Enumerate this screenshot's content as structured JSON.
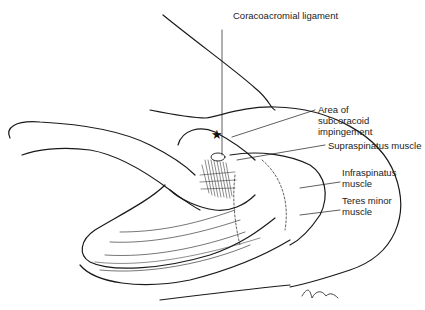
{
  "figure": {
    "type": "anatomical line illustration",
    "line_color": "#1a1a1a",
    "background": "#ffffff"
  },
  "labels": {
    "coracoacromial": "Coracoacromial ligament",
    "impingement": [
      "Area of",
      "subcoracoid",
      "impingement"
    ],
    "supraspinatus": "Supraspinatus muscle",
    "infraspinatus": [
      "Infraspinatus",
      "muscle"
    ],
    "teres_minor": [
      "Teres minor",
      "muscle"
    ]
  },
  "markers": {
    "star": "★"
  },
  "signature": "Quitz"
}
